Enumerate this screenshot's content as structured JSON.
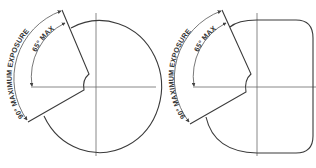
{
  "diagrams": [
    {
      "id": "round",
      "shape": "circular",
      "outer_label": "90° MAXIMUM EXPOSURE",
      "inner_label": "65° MAX"
    },
    {
      "id": "rounded-rect",
      "shape": "rounded-rectangle",
      "outer_label": "90° MAXIMUM EXPOSURE",
      "inner_label": "65° MAX"
    }
  ],
  "colors": {
    "line": "#3a3a3a",
    "axis": "#6a6a6a",
    "background": "#ffffff"
  }
}
